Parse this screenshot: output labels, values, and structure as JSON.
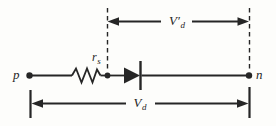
{
  "colors": {
    "ink": "#262626",
    "background": "#fdfdfb"
  },
  "diagram": {
    "terminals": {
      "left": {
        "label": "p"
      },
      "right": {
        "label": "n"
      }
    },
    "components": {
      "resistor": {
        "label_main": "r",
        "label_sub": "s"
      },
      "diode": {}
    },
    "dimensions": {
      "internal_voltage": {
        "label_main": "V′",
        "label_sub": "d"
      },
      "terminal_voltage": {
        "label_main": "V",
        "label_sub": "d"
      }
    },
    "icons": {
      "resistor": "zigzag-line",
      "diode": "triangle-with-cathode-bar",
      "terminal": "filled-dot",
      "dimension": "double-headed-arrow"
    }
  }
}
